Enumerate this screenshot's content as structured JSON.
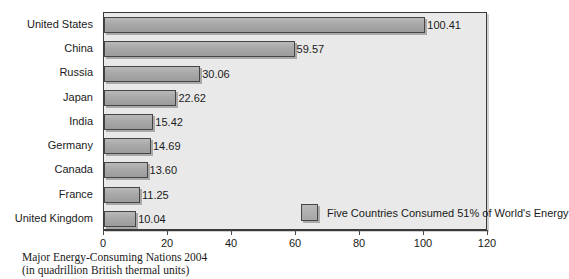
{
  "chart_data": {
    "type": "bar",
    "orientation": "horizontal",
    "title": "",
    "categories": [
      "United States",
      "China",
      "Russia",
      "Japan",
      "India",
      "Germany",
      "Canada",
      "France",
      "United Kingdom"
    ],
    "values": [
      100.41,
      59.57,
      30.06,
      22.62,
      15.42,
      14.69,
      13.6,
      11.25,
      10.04
    ],
    "value_labels": [
      "100.41",
      "59.57",
      "30.06",
      "22.62",
      "15.42",
      "14.69",
      "13.60",
      "11.25",
      "10.04"
    ],
    "xlabel": "",
    "ylabel": "",
    "xlim": [
      0,
      120
    ],
    "xticks": [
      0,
      20,
      40,
      60,
      80,
      100,
      120
    ],
    "xtick_labels": [
      "0",
      "20",
      "40",
      "60",
      "80",
      "100",
      "120"
    ],
    "grid": false,
    "legend": {
      "position": "inside-bottom-center",
      "entries": [
        "Five Countries Consumed 51% of World's Energy"
      ]
    },
    "annotations": [
      "Major Energy-Consuming Nations 2004",
      "(in quadrillion British thermal units)"
    ],
    "colors": {
      "bar_fill": "#a8a8a8",
      "bar_border": "#454545",
      "plot_background": "#e9e9e9",
      "page_background": "#ffffff",
      "text": "#1a1a1a"
    }
  },
  "caption": {
    "line1": "Major Energy-Consuming Nations 2004",
    "line2": "(in quadrillion British thermal units)"
  },
  "legend": {
    "label": "Five Countries Consumed 51% of World's Energy"
  }
}
